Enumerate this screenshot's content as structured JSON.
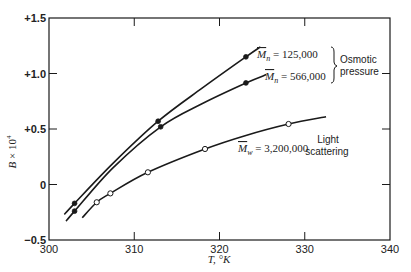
{
  "chart_data": {
    "type": "line",
    "title": "",
    "xlabel": "T, °K",
    "ylabel": "B × 10⁴",
    "xlim": [
      300,
      340
    ],
    "ylim": [
      -0.5,
      1.5
    ],
    "grid": false,
    "x_ticks": [
      300,
      310,
      320,
      330,
      340
    ],
    "x_tick_labels": [
      "300",
      "310",
      "320",
      "330",
      "340"
    ],
    "y_ticks": [
      -0.5,
      0,
      0.5,
      1.0,
      1.5
    ],
    "y_tick_labels": [
      "−0.5",
      "0",
      "+0.5",
      "+1.0",
      "+1.5"
    ],
    "series": [
      {
        "name": "M̄n = 125,000",
        "group": "Osmotic pressure",
        "marker": "filled-circle",
        "points": [
          [
            303.0,
            -0.17
          ],
          [
            312.8,
            0.57
          ],
          [
            323.1,
            1.15
          ]
        ],
        "curve": [
          [
            301.8,
            -0.27
          ],
          [
            303.0,
            -0.17
          ],
          [
            307.5,
            0.19
          ],
          [
            312.8,
            0.57
          ],
          [
            318.0,
            0.87
          ],
          [
            323.1,
            1.15
          ],
          [
            324.8,
            1.24
          ]
        ]
      },
      {
        "name": "M̄n = 566,000",
        "group": "Osmotic pressure",
        "marker": "filled-circle",
        "points": [
          [
            303.0,
            -0.24
          ],
          [
            313.1,
            0.52
          ],
          [
            323.1,
            0.915
          ]
        ],
        "curve": [
          [
            302.0,
            -0.33
          ],
          [
            303.0,
            -0.24
          ],
          [
            307.5,
            0.15
          ],
          [
            313.1,
            0.52
          ],
          [
            318.0,
            0.73
          ],
          [
            323.1,
            0.915
          ],
          [
            325.5,
            0.99
          ]
        ]
      },
      {
        "name": "M̄w = 3,200,000",
        "group": "Light scattering",
        "marker": "open-circle",
        "points": [
          [
            305.6,
            -0.16
          ],
          [
            307.2,
            -0.08
          ],
          [
            311.6,
            0.11
          ],
          [
            318.3,
            0.32
          ],
          [
            328.1,
            0.545
          ]
        ],
        "curve": [
          [
            303.9,
            -0.3
          ],
          [
            305.6,
            -0.16
          ],
          [
            307.2,
            -0.08
          ],
          [
            311.6,
            0.11
          ],
          [
            318.3,
            0.32
          ],
          [
            323.0,
            0.44
          ],
          [
            328.1,
            0.545
          ],
          [
            332.5,
            0.61
          ]
        ]
      }
    ],
    "annotations": [
      {
        "text": "M̄n = 125,000",
        "at": [
          325.0,
          1.25
        ]
      },
      {
        "text": "M̄n = 566,000",
        "at": [
          325.5,
          1.0
        ]
      },
      {
        "text": "Osmotic pressure",
        "bracket_groups": [
          "M̄n = 125,000",
          "M̄n = 566,000"
        ]
      },
      {
        "text": "M̄w = 3,200,000",
        "at": [
          320.5,
          0.34
        ]
      },
      {
        "text": "Light scattering",
        "at": [
          335,
          0.35
        ]
      }
    ]
  },
  "labels": {
    "y_axis_title_main": "B",
    "y_axis_title_rest": " × 10",
    "y_axis_exp": "4",
    "x_axis_title": "T, °K",
    "ann_mn1_sym": "M",
    "ann_mn1_sub": "n",
    "ann_mn1_val": " = 125,000",
    "ann_mn2_sym": "M",
    "ann_mn2_sub": "n",
    "ann_mn2_val": " = 566,000",
    "ann_mw_sym": "M",
    "ann_mw_sub": "w",
    "ann_mw_val": " = 3,200,000",
    "osmotic_line1": "Osmotic",
    "osmotic_line2": "pressure",
    "light_line1": "Light",
    "light_line2": "scattering"
  },
  "colors": {
    "ink": "#1a1a1a",
    "background": "#ffffff"
  }
}
